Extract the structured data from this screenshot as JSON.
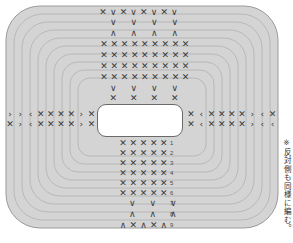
{
  "diagram": {
    "note_text": "※反対側も同様に編む。",
    "colors": {
      "fabric_fill": "#d4d4d4",
      "ring_stroke": "#b0b0b0",
      "outline_stroke": "#9a9a9a",
      "symbol_color": "#3a3a3a",
      "opening_fill": "#ffffff",
      "opening_stroke": "#6a6a6a",
      "background": "#ffffff"
    },
    "shape": {
      "name": "rounded-rectangle-outline",
      "ring_count": 9,
      "outer_radius": 34
    },
    "opening": {
      "name": "center-slot",
      "shape": "rounded-rectangle",
      "x": 97,
      "y": 104,
      "width": 86,
      "height": 33
    }
  },
  "symbols": {
    "cross": "✕",
    "v_stitch": "∨",
    "caret": "∧",
    "lt": "‹",
    "gt": "›"
  },
  "top_block": {
    "name": "top-symbol-block",
    "rows": [
      {
        "id": "t1",
        "top": 8,
        "left": 98,
        "step": 10.2,
        "text": "✕∨✕∨✕∨✕∨"
      },
      {
        "id": "t2",
        "top": 18,
        "left": 103,
        "step": 20.5,
        "text": "∨∨∨∨"
      },
      {
        "id": "t3",
        "top": 29,
        "left": 103,
        "step": 20.5,
        "text": "∧∧∧∧"
      },
      {
        "id": "t4",
        "top": 40,
        "left": 99,
        "step": 10.2,
        "text": "✕✕✕✕✕✕✕✕✕"
      },
      {
        "id": "t5",
        "top": 51,
        "left": 99,
        "step": 10.2,
        "text": "✕✕✕✕✕✕✕✕✕"
      },
      {
        "id": "t6",
        "top": 62,
        "left": 99,
        "step": 10.2,
        "text": "✕✕✕✕✕✕✕✕✕"
      },
      {
        "id": "t7",
        "top": 73,
        "left": 99,
        "step": 10.2,
        "text": "✕✕✕✕✕✕✕✕✕"
      },
      {
        "id": "t8",
        "top": 84,
        "left": 103,
        "step": 20.5,
        "text": "∨∨∨∨"
      },
      {
        "id": "t9",
        "top": 94,
        "left": 103,
        "step": 20.5,
        "text": "✕✕✕✕"
      }
    ]
  },
  "left_band": {
    "name": "left-symbol-band",
    "rows": [
      {
        "id": "l1",
        "top": 110,
        "left": 5,
        "step": 10.2,
        "text": "››‹✕✕✕✕›✕"
      },
      {
        "id": "l2",
        "top": 120,
        "left": 5,
        "step": 10.2,
        "text": "✕›‹✕✕✕✕›✕"
      }
    ]
  },
  "right_band": {
    "name": "right-symbol-band",
    "rows": [
      {
        "id": "r1",
        "top": 110,
        "left": 186,
        "step": 10.2,
        "text": "✕‹✕✕✕✕›‹✕"
      },
      {
        "id": "r2",
        "top": 120,
        "left": 186,
        "step": 10.2,
        "text": "✕‹✕✕✕✕›‹‹"
      }
    ]
  },
  "bottom_block": {
    "name": "bottom-symbol-block",
    "rows": [
      {
        "id": "b1",
        "row_label": "1",
        "top": 139,
        "left": 118,
        "step": 10.2,
        "text": "✕✕✕✕✕"
      },
      {
        "id": "b2",
        "row_label": "2",
        "top": 149,
        "left": 118,
        "step": 10.2,
        "text": "✕✕✕✕✕"
      },
      {
        "id": "b3",
        "row_label": "3",
        "top": 159,
        "left": 118,
        "step": 10.2,
        "text": "✕✕✕✕✕"
      },
      {
        "id": "b4",
        "row_label": "4",
        "top": 169,
        "left": 118,
        "step": 10.2,
        "text": "✕✕✕✕✕"
      },
      {
        "id": "b5",
        "row_label": "5",
        "top": 179,
        "left": 118,
        "step": 10.2,
        "text": "✕✕✕✕✕"
      },
      {
        "id": "b6",
        "row_label": "6",
        "top": 189,
        "left": 118,
        "step": 10.2,
        "text": "✕✕✕✕✕"
      },
      {
        "id": "b7",
        "row_label": "7",
        "top": 199,
        "left": 122,
        "step": 20.5,
        "text": "∨∨∨"
      },
      {
        "id": "b8",
        "row_label": "8",
        "top": 210,
        "left": 122,
        "step": 20.5,
        "text": "∧∧∧"
      },
      {
        "id": "b9",
        "row_label": "9",
        "top": 221,
        "left": 118,
        "step": 10.2,
        "text": "∧✕∧✕∧"
      }
    ],
    "row_numbers": [
      "1",
      "2",
      "3",
      "4",
      "5",
      "6",
      "7",
      "8",
      "9"
    ]
  }
}
